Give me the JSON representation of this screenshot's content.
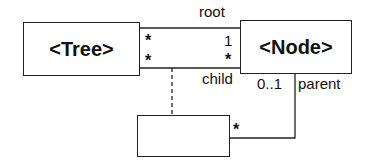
{
  "diagram": {
    "type": "uml-class-association",
    "classes": [
      {
        "id": "tree",
        "label": "<Tree>"
      },
      {
        "id": "node",
        "label": "<Node>"
      },
      {
        "id": "association_class",
        "label": ""
      }
    ],
    "associations": [
      {
        "from": "tree",
        "to": "node",
        "tree_end_multiplicity": "*",
        "node_end_multiplicity": "1",
        "node_role": "root"
      },
      {
        "from": "tree",
        "to": "node",
        "tree_end_multiplicity": "*",
        "node_end_multiplicity": "*",
        "node_role": "child"
      },
      {
        "from": "association_class",
        "to": "node",
        "class_end_multiplicity": "*",
        "node_end_multiplicity": "0..1",
        "node_role": "parent"
      }
    ],
    "labels": {
      "root": "root",
      "child": "child",
      "parent": "parent",
      "tree_top_mult": "*",
      "tree_bottom_mult": "*",
      "node_top_mult": "1",
      "node_bottom_mult": "*",
      "parent_mult": "0..1",
      "assoc_box_mult": "*"
    },
    "colors": {
      "line": "#222222",
      "background": "#ffffff",
      "text": "#111111"
    }
  }
}
